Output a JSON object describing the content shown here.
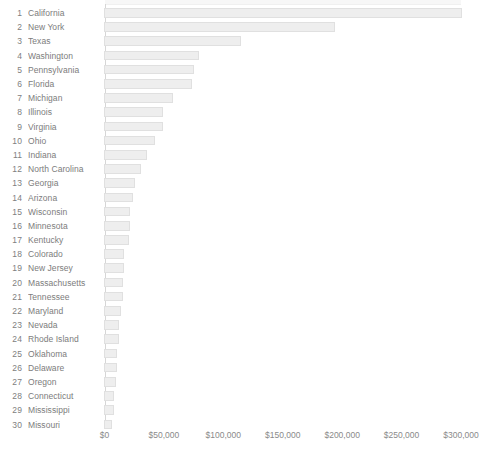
{
  "chart_data": {
    "type": "bar",
    "orientation": "horizontal",
    "title": "",
    "xlabel": "",
    "ylabel": "",
    "xlim": [
      0,
      300000
    ],
    "xticks": [
      0,
      50000,
      100000,
      150000,
      200000,
      250000,
      300000
    ],
    "xtick_labels": [
      "$0",
      "$50,000",
      "$100,000",
      "$150,000",
      "$200,000",
      "$250,000",
      "$300,000"
    ],
    "grid": false,
    "legend": "none",
    "categories": [
      "California",
      "New York",
      "Texas",
      "Washington",
      "Pennsylvania",
      "Florida",
      "Michigan",
      "Illinois",
      "Virginia",
      "Ohio",
      "Indiana",
      "North Carolina",
      "Georgia",
      "Arizona",
      "Wisconsin",
      "Minnesota",
      "Kentucky",
      "Colorado",
      "New Jersey",
      "Massachusetts",
      "Tennessee",
      "Maryland",
      "Nevada",
      "Rhode Island",
      "Oklahoma",
      "Delaware",
      "Oregon",
      "Connecticut",
      "Mississippi",
      "Missouri"
    ],
    "values": [
      301000,
      194000,
      115000,
      80000,
      76000,
      74000,
      58000,
      50000,
      50000,
      43000,
      36000,
      31000,
      26000,
      24000,
      22000,
      22000,
      21000,
      17000,
      17000,
      16000,
      16000,
      14000,
      13000,
      13000,
      11000,
      11000,
      10000,
      8000,
      8000,
      7000
    ],
    "ranks": [
      "1",
      "2",
      "3",
      "4",
      "5",
      "6",
      "7",
      "8",
      "9",
      "10",
      "11",
      "12",
      "13",
      "14",
      "15",
      "16",
      "17",
      "18",
      "19",
      "20",
      "21",
      "22",
      "23",
      "24",
      "25",
      "26",
      "27",
      "28",
      "29",
      "30"
    ]
  },
  "colors": {
    "bar_fill": "#eeeeee",
    "bar_border": "#e0e0e0",
    "axis_line": "#d6d6d6",
    "text": "#7c7c7c",
    "background": "#ffffff"
  }
}
